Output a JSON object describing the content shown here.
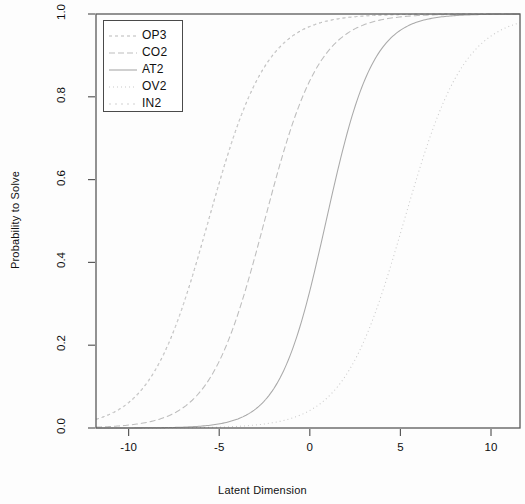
{
  "chart_data": {
    "type": "line",
    "title": "",
    "xlabel": "Latent Dimension",
    "ylabel": "Probability to Solve",
    "xlim": [
      -11.8,
      11.6
    ],
    "ylim": [
      0.0,
      1.0
    ],
    "xticks": [
      -10,
      -5,
      0,
      5,
      10
    ],
    "xtick_labels": [
      "-10",
      "-5",
      "0",
      "5",
      "10"
    ],
    "yticks": [
      0.0,
      0.2,
      0.4,
      0.6,
      0.8,
      1.0
    ],
    "ytick_labels": [
      "0.0",
      "0.2",
      "0.4",
      "0.6",
      "0.8",
      "1.0"
    ],
    "grid": false,
    "legend_position": "top-left",
    "curve_model": "logistic",
    "series": [
      {
        "name": "OP3",
        "color": "#b9b9b9",
        "dash": "3,3",
        "difficulty": -5.6,
        "slope": 0.62,
        "x": [
          -11.8,
          -10,
          -9,
          -8,
          -7.5,
          -7,
          -6.5,
          -6,
          -5.6,
          -5.2,
          -4.7,
          -4.2,
          -3.7,
          -3.2,
          -2.5,
          -1.5,
          0,
          2,
          5,
          8,
          11.6
        ],
        "y": [
          0.02,
          0.06,
          0.1,
          0.18,
          0.23,
          0.3,
          0.38,
          0.47,
          0.5,
          0.56,
          0.65,
          0.73,
          0.79,
          0.85,
          0.91,
          0.95,
          0.98,
          0.99,
          1.0,
          1.0,
          1.0
        ]
      },
      {
        "name": "CO2",
        "color": "#bdbdbd",
        "dash": "6,3",
        "difficulty": -2.5,
        "slope": 0.66,
        "x": [
          -11.8,
          -9,
          -7.5,
          -6.5,
          -5.5,
          -4.5,
          -3.8,
          -3.1,
          -2.5,
          -1.9,
          -1.2,
          -0.5,
          0.2,
          1,
          2,
          3.5,
          5.5,
          8,
          11.6
        ],
        "y": [
          0.01,
          0.02,
          0.04,
          0.07,
          0.12,
          0.2,
          0.29,
          0.4,
          0.5,
          0.6,
          0.71,
          0.8,
          0.86,
          0.91,
          0.95,
          0.98,
          0.99,
          1.0,
          1.0
        ]
      },
      {
        "name": "AT2",
        "color": "#a9a9a9",
        "dash": "none",
        "difficulty": 0.9,
        "slope": 0.78,
        "x": [
          -11.8,
          -8,
          -6,
          -4.5,
          -3.5,
          -2.5,
          -1.6,
          -0.8,
          0.1,
          0.9,
          1.7,
          2.5,
          3.3,
          4.2,
          5.5,
          7,
          9,
          11.6
        ],
        "y": [
          0.0,
          0.01,
          0.02,
          0.03,
          0.05,
          0.09,
          0.16,
          0.27,
          0.43,
          0.5,
          0.65,
          0.79,
          0.88,
          0.93,
          0.97,
          0.99,
          1.0,
          1.0
        ]
      },
      {
        "name": "OV2",
        "color": "#cacaca",
        "dash": "1,3",
        "difficulty": 5.2,
        "slope": 0.6,
        "x": [
          -11.8,
          -6,
          -3,
          -1,
          0.5,
          1.5,
          2.5,
          3.3,
          4.1,
          5.2,
          6.2,
          7.1,
          8,
          9,
          10,
          11.6
        ],
        "y": [
          0.0,
          0.0,
          0.01,
          0.02,
          0.04,
          0.06,
          0.1,
          0.17,
          0.3,
          0.5,
          0.68,
          0.8,
          0.88,
          0.94,
          0.97,
          0.99
        ]
      },
      {
        "name": "IN2",
        "color": "#d2d2d2",
        "dash": "2,4",
        "difficulty": -5.6,
        "slope": 0.62,
        "x": [
          -11.8,
          -10,
          -9,
          -8,
          -7.5,
          -7,
          -6.5,
          -6,
          -5.6,
          -5.2,
          -4.7,
          -4.2,
          -3.7,
          -3.2,
          -2.5,
          -1.5,
          0,
          2,
          5,
          8,
          11.6
        ],
        "y": [
          0.02,
          0.06,
          0.1,
          0.18,
          0.23,
          0.3,
          0.38,
          0.47,
          0.5,
          0.56,
          0.65,
          0.73,
          0.79,
          0.85,
          0.91,
          0.95,
          0.98,
          0.99,
          1.0,
          1.0,
          1.0
        ]
      }
    ],
    "legend_entries": [
      "OP3",
      "CO2",
      "AT2",
      "OV2",
      "IN2"
    ]
  },
  "axes": {
    "frame_color": "#555555",
    "background": "#ffffff"
  }
}
